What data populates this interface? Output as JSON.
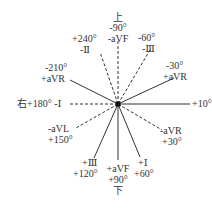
{
  "diagram": {
    "title": "",
    "center": {
      "x": 118,
      "y": 104
    },
    "directions": {
      "top": "上",
      "bottom": "下",
      "left": "右",
      "right": "左"
    },
    "axes": [
      {
        "id": "plus10",
        "angle_label": "+10°",
        "lead_label": "",
        "style": "solid"
      },
      {
        "id": "minus30",
        "angle_label": "-30°",
        "lead_label": "+aVR",
        "style": "solid"
      },
      {
        "id": "minus60",
        "angle_label": "-60°",
        "lead_label": "-Ⅲ",
        "style": "dashed"
      },
      {
        "id": "minus90",
        "angle_label": "-90°",
        "lead_label": "-aVF",
        "style": "dashed"
      },
      {
        "id": "plus240",
        "angle_label": "+240°",
        "lead_label": "-Ⅱ",
        "style": "dashed"
      },
      {
        "id": "minus210",
        "angle_label": "-210°",
        "lead_label": "+aVR",
        "style": "solid"
      },
      {
        "id": "plus180",
        "angle_label": "+180°",
        "lead_label": "-Ⅰ",
        "style": "dashed"
      },
      {
        "id": "plus150",
        "angle_label": "+150°",
        "lead_label": "-aVL",
        "style": "dashed"
      },
      {
        "id": "plus120",
        "angle_label": "+120°",
        "lead_label": "+Ⅲ",
        "style": "solid"
      },
      {
        "id": "plus90",
        "angle_label": "+90°",
        "lead_label": "+aVF",
        "style": "solid"
      },
      {
        "id": "plus60",
        "angle_label": "+60°",
        "lead_label": "+Ⅰ",
        "style": "solid"
      },
      {
        "id": "plus30",
        "angle_label": "+30°",
        "lead_label": "-aVR",
        "style": "dashed"
      }
    ],
    "labels": {
      "top_dir": "上",
      "top_angle": "-90°",
      "top_lead": "-aVF",
      "m60_angle": "-60°",
      "m60_lead": "-Ⅲ",
      "m30_angle": "-30°",
      "m30_lead": "+aVR",
      "p240_angle": "+240°",
      "p240_lead": "-Ⅱ",
      "m210_angle": "-210°",
      "m210_lead": "+aVR",
      "left_text": "右+180° -Ⅰ",
      "right_text": "+10°左",
      "p150_lead": "-aVL",
      "p150_angle": "+150°",
      "p30_lead": "-aVR",
      "p30_angle": "+30°",
      "p120_lead": "+Ⅲ",
      "p120_angle": "+120°",
      "p90_lead": "+aVF",
      "p90_angle": "+90°",
      "bottom_dir": "下",
      "p60_lead": "+Ⅰ",
      "p60_angle": "+60°"
    },
    "colors": {
      "line": "#333333",
      "background": "#ffffff"
    }
  }
}
